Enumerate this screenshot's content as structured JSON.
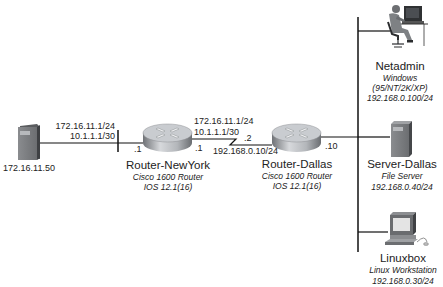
{
  "colors": {
    "line": "#111111",
    "router_body": "#a9acb0",
    "router_top": "#c9ccd0",
    "server_body": "#7d7f82",
    "background": "#ffffff"
  },
  "hosts": {
    "left_server": {
      "icon": "server-tower-icon",
      "ip": "172.16.11.50"
    },
    "netadmin": {
      "icon": "admin-workstation-icon",
      "name": "Netadmin",
      "os": "Windows",
      "os_versions": "(95/NT/2K/XP)",
      "ip": "192.168.0.100/24"
    },
    "server_dallas": {
      "icon": "server-tower-icon",
      "name": "Server-Dallas",
      "role": "File Server",
      "ip": "192.168.0.40/24"
    },
    "linuxbox": {
      "icon": "desktop-computer-icon",
      "name": "Linuxbox",
      "role": "Linux Workstation",
      "ip": "192.168.0.30/24"
    }
  },
  "routers": {
    "newyork": {
      "icon": "router-icon",
      "name": "Router-NewYork",
      "model": "Cisco 1600 Router",
      "ios": "IOS 12.1(16)",
      "left_if": ".1",
      "right_if": ".1"
    },
    "dallas": {
      "icon": "router-icon",
      "name": "Router-Dallas",
      "model": "Cisco 1600 Router",
      "ios": "IOS 12.1(16)",
      "left_if": ".2",
      "right_if": ".10"
    }
  },
  "links": {
    "lan_left": {
      "line1": "172.16.11.1/24",
      "line2": "10.1.1.1/30"
    },
    "serial": {
      "line1": "172.16.11.1/24",
      "line2": "10.1.1.1/30",
      "line3": "192.168.0.10/24"
    }
  }
}
